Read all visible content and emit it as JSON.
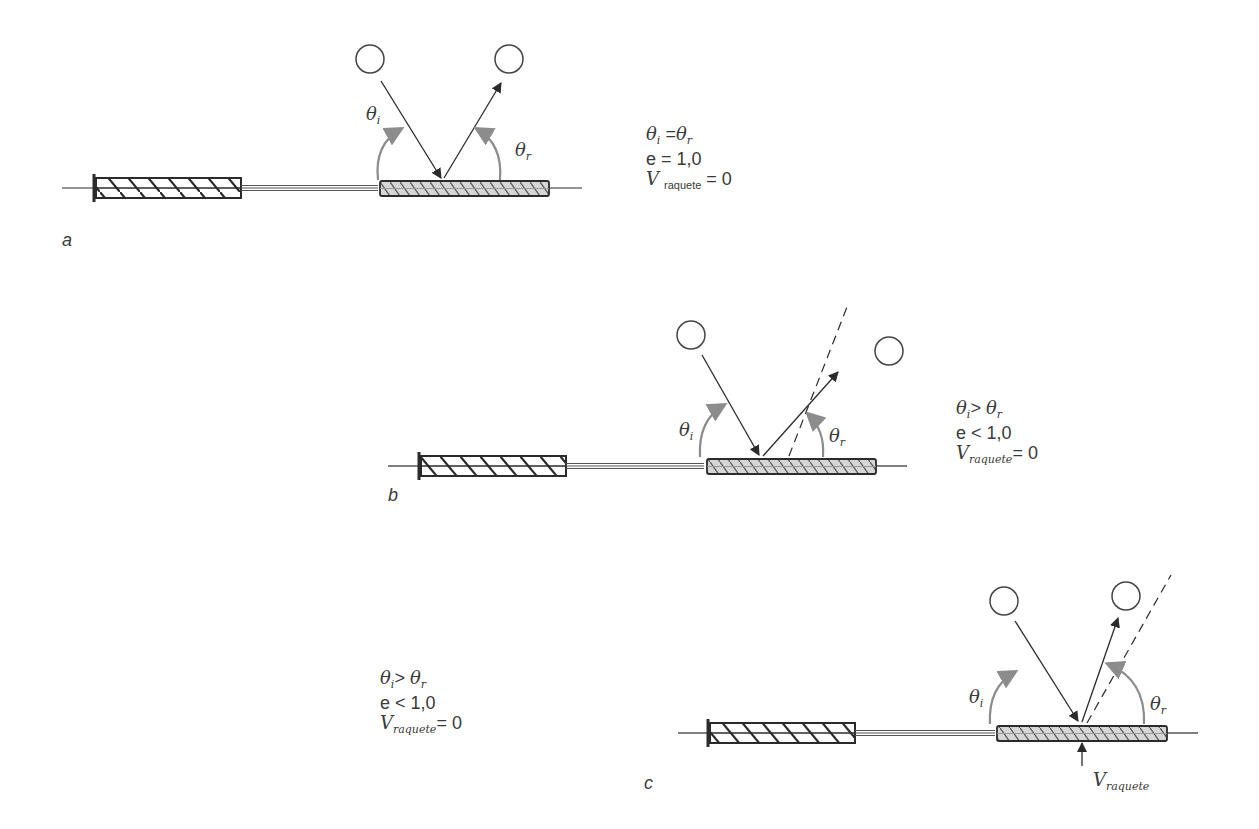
{
  "panels": [
    {
      "id": "a",
      "label": "a",
      "angle_incident_label": "θ",
      "angle_incident_sub": "i",
      "angle_reflected_label": "θ",
      "angle_reflected_sub": "r",
      "equations": {
        "relation_lhs": "θ",
        "relation_lhs_sub": "i",
        "relation_op": " =",
        "relation_rhs": "θ",
        "relation_rhs_sub": "r",
        "restitution": "e = 1,0",
        "velocity_symbol": "V",
        "velocity_sub": "raquete",
        "velocity_value": " = 0"
      }
    },
    {
      "id": "b",
      "label": "b",
      "angle_incident_label": "θ",
      "angle_incident_sub": "i",
      "angle_reflected_label": "θ",
      "angle_reflected_sub": "r",
      "equations": {
        "relation_lhs": "θ",
        "relation_lhs_sub": "i",
        "relation_op": "> ",
        "relation_rhs": "θ",
        "relation_rhs_sub": "r",
        "restitution": "e < 1,0",
        "velocity_symbol": "V",
        "velocity_sub": "raquete",
        "velocity_value": "= 0"
      }
    },
    {
      "id": "c",
      "label": "c",
      "angle_incident_label": "θ",
      "angle_incident_sub": "i",
      "angle_reflected_label": "θ",
      "angle_reflected_sub": "r",
      "racket_velocity_symbol": "V",
      "racket_velocity_sub": "raquete",
      "equations": {
        "relation_lhs": "θ",
        "relation_lhs_sub": "i",
        "relation_op": "> ",
        "relation_rhs": "θ",
        "relation_rhs_sub": "r",
        "restitution": "e < 1,0",
        "velocity_symbol": "V",
        "velocity_sub": "raquete",
        "velocity_value": "= 0"
      }
    }
  ],
  "colors": {
    "line": "#2b2b2b",
    "angle_arc": "#8c8c8c",
    "racket_fill": "#d2d2d2",
    "text": "#3a3a3a"
  }
}
